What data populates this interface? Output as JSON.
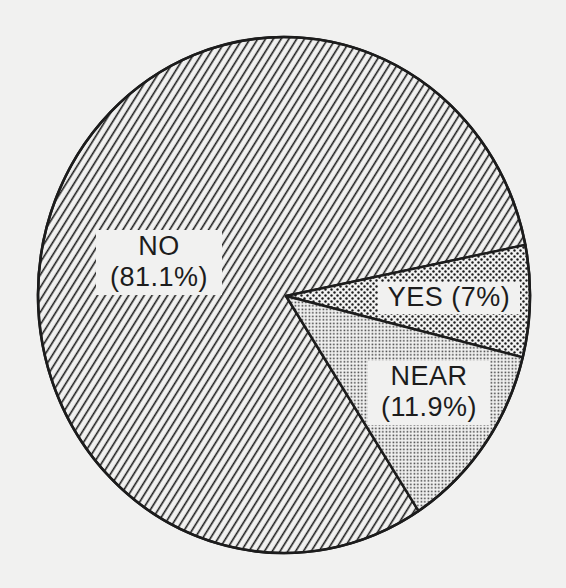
{
  "chart_data": {
    "type": "pie",
    "title": "",
    "categories": [
      "NO",
      "YES",
      "NEAR"
    ],
    "values": [
      81.1,
      7.0,
      11.9
    ],
    "unit": "%",
    "slices": [
      {
        "name": "NO",
        "value": 81.1,
        "label_line1": "NO",
        "label_line2": "(81.1%)",
        "pattern": "diagonal-hatch"
      },
      {
        "name": "YES",
        "value": 7.0,
        "label_line1": "YES (7%)",
        "label_line2": "",
        "pattern": "coarse-dots"
      },
      {
        "name": "NEAR",
        "value": 11.9,
        "label_line1": "NEAR",
        "label_line2": "(11.9%)",
        "pattern": "fine-dots"
      }
    ],
    "legend": "none (labels inside slices)",
    "style": "black-and-white print, patterned fills"
  },
  "colors": {
    "ink": "#1c1c1c",
    "paper": "#f1f1f0"
  }
}
